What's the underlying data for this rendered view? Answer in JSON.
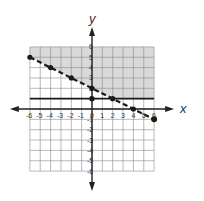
{
  "chart_data": {
    "type": "line",
    "title": "",
    "xlabel": "x",
    "ylabel": "y",
    "xlim": [
      -6,
      6
    ],
    "ylim": [
      -6,
      6
    ],
    "grid": true,
    "x_ticks": [
      "-6",
      "-5",
      "-4",
      "-3",
      "-2",
      "-1",
      "0",
      "1",
      "2",
      "3",
      "4",
      "5",
      "6"
    ],
    "y_ticks": [
      "6",
      "5",
      "4",
      "3",
      "2",
      "1",
      "-1",
      "-2",
      "-3",
      "-4",
      "-5",
      "-6"
    ],
    "series": [
      {
        "name": "dashed boundary",
        "style": "dashed",
        "equation": "y = -1/2 x + 2",
        "x": [
          -6,
          -4,
          -2,
          0,
          2,
          4,
          6
        ],
        "y": [
          5,
          4,
          3,
          2,
          1,
          0,
          -1
        ]
      },
      {
        "name": "solid boundary",
        "style": "solid",
        "equation": "y = 1",
        "x": [
          -6,
          0,
          6
        ],
        "y": [
          1,
          1,
          1
        ]
      }
    ],
    "shaded_region": "y >= 1 and y > -1/2 x + 2",
    "colors": {
      "shade": "#d9d9d9",
      "grid": "#8a8a8a",
      "line": "#1a1a1a"
    }
  }
}
